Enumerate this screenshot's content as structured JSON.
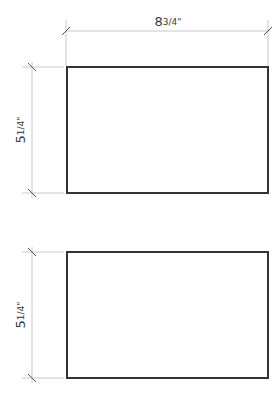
{
  "diagram": {
    "title": "",
    "top_dimension": {
      "whole": "8",
      "fraction": "3/4",
      "unit": "\"",
      "label": "8 3/4\""
    },
    "panels": [
      {
        "name": "upper-rectangle",
        "height_dimension": {
          "whole": "5",
          "fraction": "1/4",
          "unit": "\"",
          "label": "5 1/4\""
        }
      },
      {
        "name": "lower-rectangle",
        "height_dimension": {
          "whole": "5",
          "fraction": "1/4",
          "unit": "\"",
          "label": "5 1/4\""
        }
      }
    ],
    "colors": {
      "outline": "#333333",
      "dimension_line": "#c8c8c8",
      "text": "#3a3a3a"
    }
  }
}
